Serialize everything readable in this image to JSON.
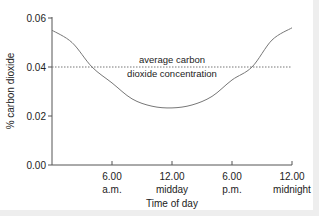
{
  "chart_data": {
    "type": "line",
    "title": "",
    "xlabel": "Time of day",
    "ylabel": "% carbon dioxide",
    "xlim": [
      0,
      24
    ],
    "ylim": [
      0,
      0.06
    ],
    "grid": false,
    "x_ticks": [
      {
        "value": 6,
        "line1": "6.00",
        "line2": "a.m."
      },
      {
        "value": 12,
        "line1": "12.00",
        "line2": "midday"
      },
      {
        "value": 18,
        "line1": "6.00",
        "line2": "p.m."
      },
      {
        "value": 24,
        "line1": "12.00",
        "line2": "midnight"
      }
    ],
    "y_ticks": [
      "0.00",
      "0.02",
      "0.04",
      "0.06"
    ],
    "series": [
      {
        "name": "carbon dioxide concentration",
        "x": [
          0,
          2,
          4,
          6,
          8,
          10,
          12,
          14,
          16,
          18,
          20,
          22,
          24
        ],
        "values": [
          0.055,
          0.05,
          0.04,
          0.0335,
          0.027,
          0.024,
          0.0233,
          0.0245,
          0.028,
          0.0347,
          0.04,
          0.051,
          0.056
        ]
      }
    ],
    "reference_line": {
      "y": 0.04,
      "style": "dotted",
      "label_line1": "average carbon",
      "label_line2": "dioxide concentration"
    }
  },
  "labels": {
    "y0": "0.00",
    "y1": "0.02",
    "y2": "0.04",
    "y3": "0.06",
    "x1a": "6.00",
    "x1b": "a.m.",
    "x2a": "12.00",
    "x2b": "midday",
    "x3a": "6.00",
    "x3b": "p.m.",
    "x4a": "12.00",
    "x4b": "midnight",
    "xtitle": "Time of day",
    "ytitle": "% carbon dioxide",
    "annot1": "average carbon",
    "annot2": "dioxide concentration"
  }
}
